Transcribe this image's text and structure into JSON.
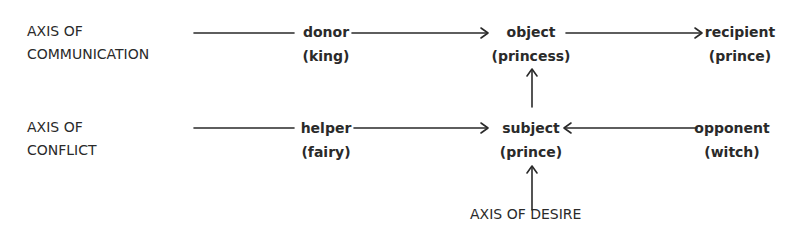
{
  "axes": {
    "communication": {
      "line1": "AXIS OF",
      "line2": "COMMUNICATION"
    },
    "conflict": {
      "line1": "AXIS OF",
      "line2": "CONFLICT"
    },
    "desire": {
      "label": "AXIS OF DESIRE"
    }
  },
  "nodes": {
    "donor": {
      "name": "donor",
      "who": "(king)"
    },
    "object": {
      "name": "object",
      "who": "(princess)"
    },
    "recipient": {
      "name": "recipient",
      "who": "(prince)"
    },
    "helper": {
      "name": "helper",
      "who": "(fairy)"
    },
    "subject": {
      "name": "subject",
      "who": "(prince)"
    },
    "opponent": {
      "name": "opponent",
      "who": "(witch)"
    }
  },
  "colors": {
    "ink": "#2a2a2a",
    "background": "#ffffff"
  }
}
